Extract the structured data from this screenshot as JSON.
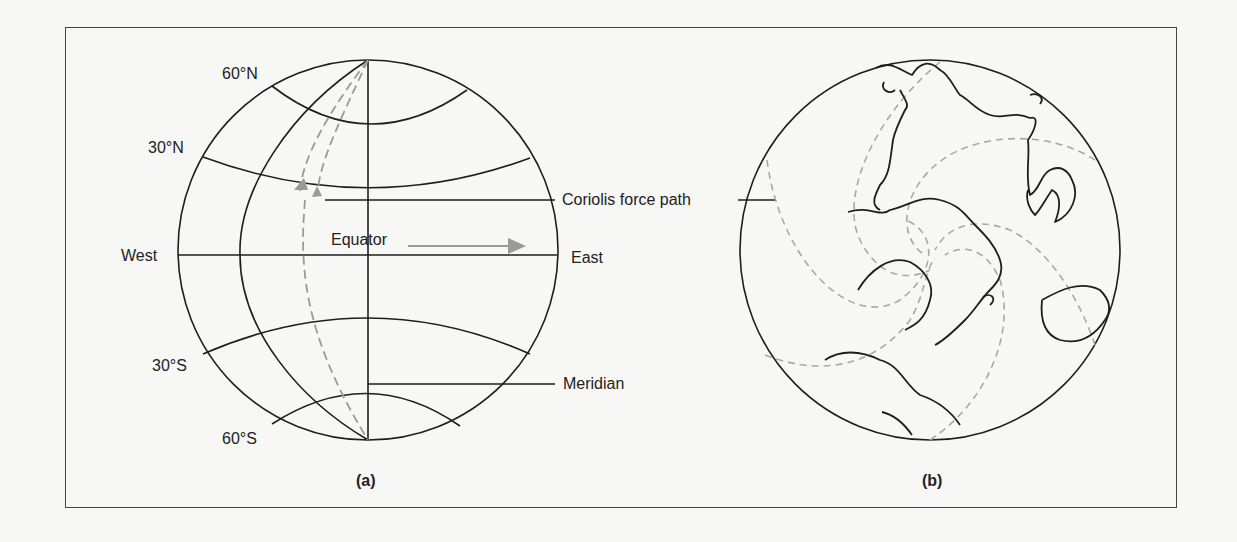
{
  "figure": {
    "panel_a": {
      "caption": "(a)",
      "labels": {
        "lat_60n": "60°N",
        "lat_30n": "30°N",
        "west": "West",
        "equator": "Equator",
        "east": "East",
        "lat_30s": "30°S",
        "lat_60s": "60°S",
        "meridian": "Meridian"
      }
    },
    "shared": {
      "coriolis_label": "Coriolis force path"
    },
    "panel_b": {
      "caption": "(b)"
    },
    "colors": {
      "line": "#1e1e1e",
      "arrow_gray": "#9a9a9a",
      "dashed_gray": "#a8a8a8",
      "background": "#f7f7f5",
      "frame": "#444444"
    }
  }
}
